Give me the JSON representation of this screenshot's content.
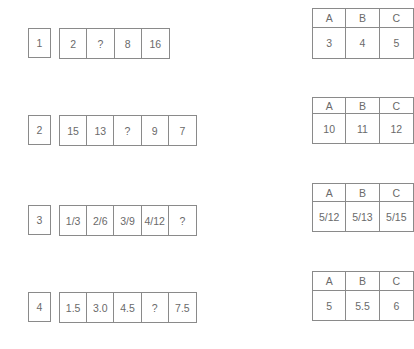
{
  "questions": [
    {
      "number": "1",
      "sequence": [
        "2",
        "?",
        "8",
        "16"
      ],
      "options": {
        "headers": [
          "A",
          "B",
          "C"
        ],
        "values": [
          "3",
          "4",
          "5"
        ]
      }
    },
    {
      "number": "2",
      "sequence": [
        "15",
        "13",
        "?",
        "9",
        "7"
      ],
      "options": {
        "headers": [
          "A",
          "B",
          "C"
        ],
        "values": [
          "10",
          "11",
          "12"
        ]
      }
    },
    {
      "number": "3",
      "sequence": [
        "1/3",
        "2/6",
        "3/9",
        "4/12",
        "?"
      ],
      "options": {
        "headers": [
          "A",
          "B",
          "C"
        ],
        "values": [
          "5/12",
          "5/13",
          "5/15"
        ]
      }
    },
    {
      "number": "4",
      "sequence": [
        "1.5",
        "3.0",
        "4.5",
        "?",
        "7.5"
      ],
      "options": {
        "headers": [
          "A",
          "B",
          "C"
        ],
        "values": [
          "5",
          "5.5",
          "6"
        ]
      }
    }
  ]
}
